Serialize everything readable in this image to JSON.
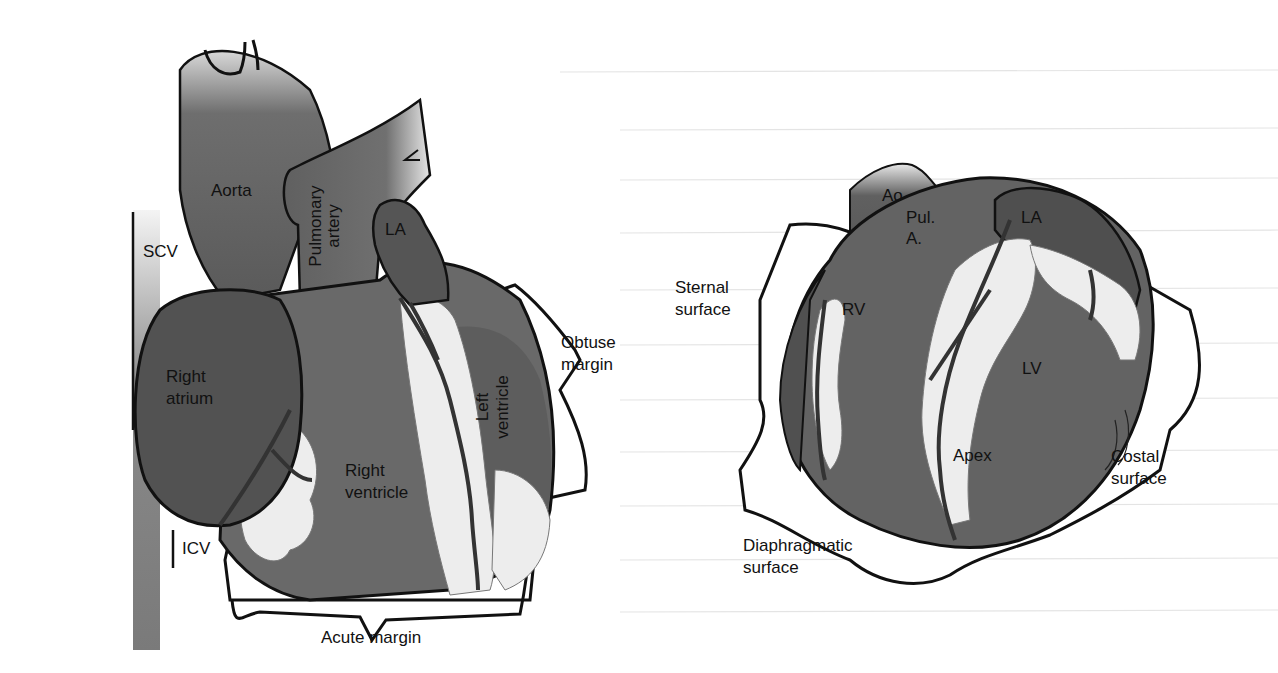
{
  "figure_left": {
    "title": "Anterior view of heart",
    "labels": {
      "aorta": "Aorta",
      "pulmonary_artery_line1": "Pulmonary",
      "pulmonary_artery_line2": "artery",
      "la": "LA",
      "scv": "SCV",
      "right_atrium_line1": "Right",
      "right_atrium_line2": "atrium",
      "right_ventricle_line1": "Right",
      "right_ventricle_line2": "ventricle",
      "left_ventricle_line1": "Left",
      "left_ventricle_line2": "ventricle",
      "obtuse_margin_line1": "Obtuse",
      "obtuse_margin_line2": "margin",
      "icv": "ICV",
      "acute_margin": "Acute margin"
    }
  },
  "figure_right": {
    "title": "Heart surfaces view",
    "labels": {
      "ao": "Ao",
      "pul_a_line1": "Pul.",
      "pul_a_line2": "A.",
      "la": "LA",
      "sternal_surface_line1": "Sternal",
      "sternal_surface_line2": "surface",
      "rv": "RV",
      "lv": "LV",
      "apex": "Apex",
      "costal_surface_line1": "Costal",
      "costal_surface_line2": "surface",
      "diaphragmatic_surface_line1": "Diaphragmatic",
      "diaphragmatic_surface_line2": "surface"
    }
  },
  "colors": {
    "heart_dark": "#4a4a4a",
    "heart_mid": "#6a6a6a",
    "fat_white": "#ececec",
    "outline": "#111111",
    "page_bg": "#ffffff",
    "bleed_text": "#d8d8d8"
  }
}
